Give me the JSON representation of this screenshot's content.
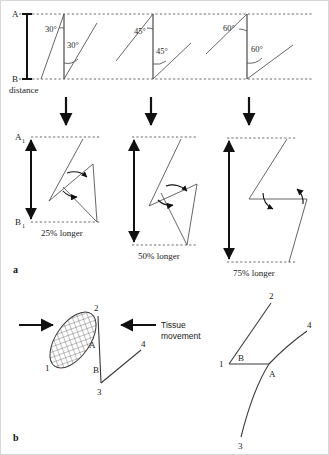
{
  "figure": {
    "panels": [
      {
        "id": "a",
        "label": "a"
      },
      {
        "id": "b",
        "label": "b"
      }
    ]
  },
  "panel_a": {
    "axis": {
      "point_a_label": "A",
      "point_b_label": "B",
      "distance_label": "distance",
      "point_a1_label": "A",
      "point_a1_sub": "1",
      "point_b1_label": "B",
      "point_b1_sub": "1"
    },
    "columns": [
      {
        "angle_top_label": "30°",
        "angle_bottom_label": "30°",
        "result_label": "25% longer",
        "gain_percent": 25,
        "angle_degrees": 30
      },
      {
        "angle_top_label": "45°",
        "angle_bottom_label": "45°",
        "result_label": "50% longer",
        "gain_percent": 50,
        "angle_degrees": 45
      },
      {
        "angle_top_label": "60°",
        "angle_bottom_label": "60°",
        "result_label": "75% longer",
        "gain_percent": 75,
        "angle_degrees": 60
      }
    ]
  },
  "panel_b": {
    "tissue_movement_line1": "Tissue",
    "tissue_movement_line2": "movement",
    "before": {
      "points": [
        "1",
        "2",
        "3",
        "4"
      ],
      "flap_labels": [
        "A",
        "B"
      ]
    },
    "after": {
      "points": [
        "1",
        "2",
        "3",
        "4"
      ],
      "flap_labels": [
        "A",
        "B"
      ]
    }
  },
  "colors": {
    "background": "#ffffff",
    "line": "#3a3a3a",
    "bold_line": "#111111",
    "dashed_line": "#5a5a5a",
    "text": "#1a1a1a"
  }
}
